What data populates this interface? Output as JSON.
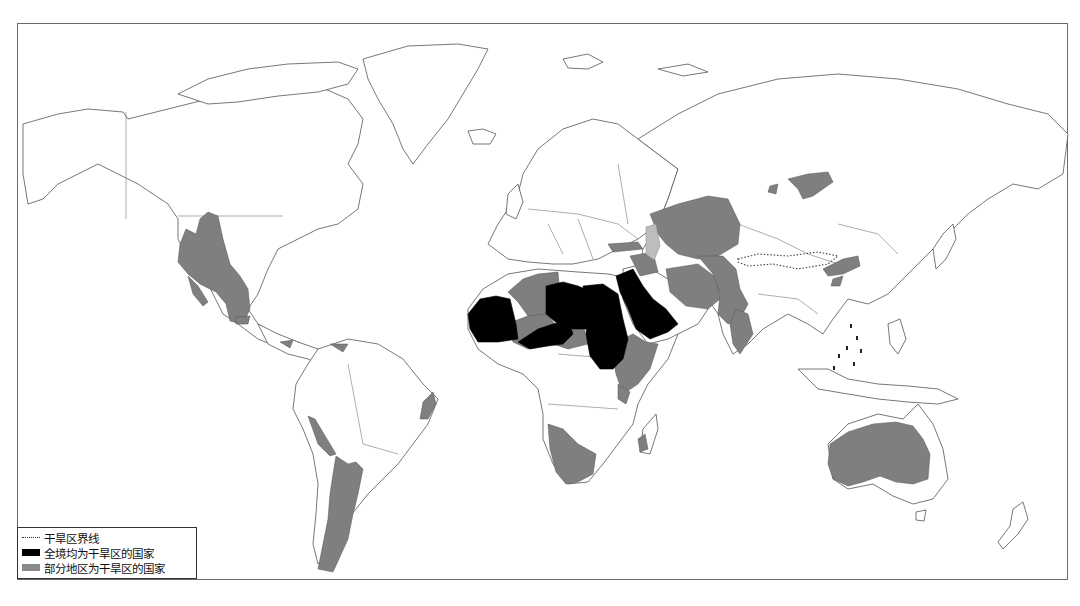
{
  "map": {
    "title": "World arid regions map",
    "colors": {
      "full_arid": "#000000",
      "partial_arid": "#7f7f7f",
      "boundary_line": "#444444",
      "land_outline": "#555555"
    },
    "regions": {
      "full_arid_countries": [
        "Mauritania",
        "Niger",
        "Libya",
        "Egypt",
        "Sudan",
        "Saudi Arabia"
      ],
      "partial_arid_regions": [
        "Western USA",
        "Northern Mexico",
        "Western South America",
        "Argentina",
        "Northeast Brazil",
        "Morocco",
        "Algeria",
        "Mali",
        "Chad",
        "Ethiopia",
        "Somalia",
        "Kenya",
        "Southern Africa",
        "Madagascar",
        "Middle East",
        "Iran",
        "Central Asia",
        "Kazakhstan",
        "Afghanistan",
        "Pakistan",
        "Western India",
        "Mongolia",
        "Northern China",
        "Australia"
      ]
    }
  },
  "legend": {
    "items": [
      {
        "label": "干旱区界线",
        "symbol": "dotted-line"
      },
      {
        "label": "全境均为干旱区的国家",
        "symbol": "black-fill"
      },
      {
        "label": "部分地区为干旱区的国家",
        "symbol": "gray-fill"
      }
    ]
  }
}
